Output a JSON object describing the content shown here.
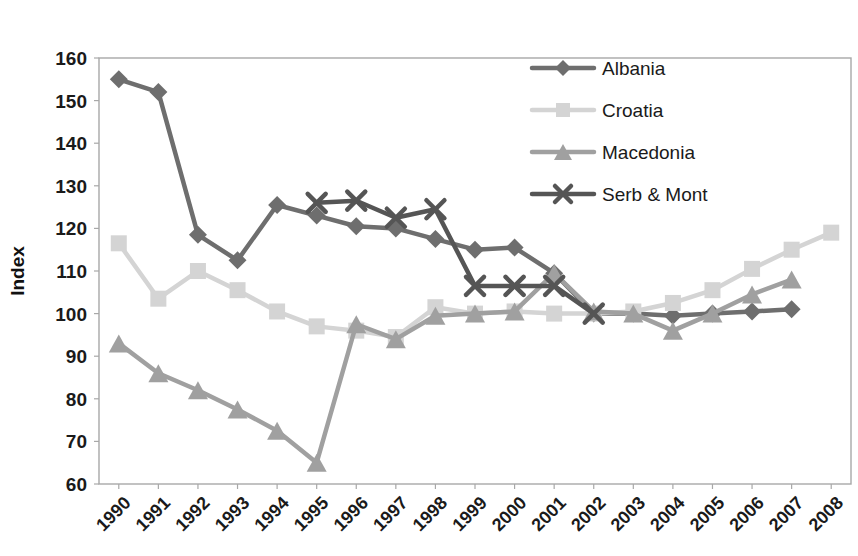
{
  "chart_data": {
    "type": "line",
    "title": "",
    "xlabel": "",
    "ylabel": "Index",
    "ylim": [
      60,
      160
    ],
    "ytick_step": 10,
    "yticks": [
      60,
      70,
      80,
      90,
      100,
      110,
      120,
      130,
      140,
      150,
      160
    ],
    "grid": false,
    "legend_position": "top-right",
    "categories": [
      "1990",
      "1991",
      "1992",
      "1993",
      "1994",
      "1995",
      "1996",
      "1997",
      "1998",
      "1999",
      "2000",
      "2001",
      "2002",
      "2003",
      "2004",
      "2005",
      "2006",
      "2007",
      "2008"
    ],
    "series": [
      {
        "name": "Albania",
        "color": "#6e6e6e",
        "marker": "diamond",
        "values": [
          155,
          152,
          118.5,
          112.5,
          125.5,
          123,
          120.5,
          120,
          117.5,
          115,
          115.5,
          109.5,
          100,
          100,
          99.5,
          100,
          100.5,
          101,
          null
        ]
      },
      {
        "name": "Croatia",
        "color": "#d4d4d4",
        "marker": "square",
        "values": [
          116.5,
          103.5,
          110,
          105.5,
          100.5,
          97,
          96,
          94.5,
          101.5,
          100,
          100.5,
          100,
          100,
          100.5,
          102.5,
          105.5,
          110.5,
          115,
          119
        ]
      },
      {
        "name": "Macedonia",
        "color": "#a0a0a0",
        "marker": "triangle",
        "values": [
          93,
          86,
          82,
          77.5,
          72.5,
          65,
          97.5,
          94,
          99.5,
          100,
          100.5,
          109.5,
          100.5,
          100,
          96,
          100,
          104.5,
          108,
          null
        ]
      },
      {
        "name": "Serb & Mont",
        "color": "#555555",
        "marker": "cross",
        "values": [
          null,
          null,
          null,
          null,
          null,
          126,
          126.5,
          122.5,
          124.5,
          106.5,
          106.5,
          106.5,
          100,
          null,
          null,
          null,
          null,
          null,
          null
        ]
      }
    ]
  },
  "axis": {
    "y_label": "Index",
    "y_tick_labels": [
      "160",
      "150",
      "140",
      "130",
      "120",
      "110",
      "100",
      "90",
      "80",
      "70",
      "60"
    ],
    "x_tick_labels": [
      "1990",
      "1991",
      "1992",
      "1993",
      "1994",
      "1995",
      "1996",
      "1997",
      "1998",
      "1999",
      "2000",
      "2001",
      "2002",
      "2003",
      "2004",
      "2005",
      "2006",
      "2007",
      "2008"
    ]
  },
  "legend": {
    "items": [
      {
        "label": "Albania",
        "color": "#6e6e6e",
        "marker": "diamond"
      },
      {
        "label": "Croatia",
        "color": "#d4d4d4",
        "marker": "square"
      },
      {
        "label": "Macedonia",
        "color": "#a0a0a0",
        "marker": "triangle"
      },
      {
        "label": "Serb & Mont",
        "color": "#555555",
        "marker": "cross"
      }
    ]
  }
}
